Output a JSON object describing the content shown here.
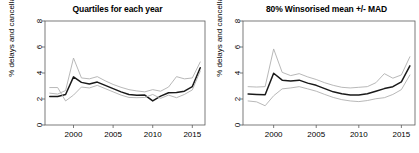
{
  "figure": {
    "width": 419,
    "height": 153,
    "background": "#ffffff",
    "panels": [
      "left",
      "right"
    ]
  },
  "chart_data": [
    {
      "panel": "left",
      "type": "line",
      "title": "Quartiles for each year",
      "xlabel": "",
      "ylabel": "% delays and cancellations",
      "xlim": [
        1996.4,
        2016.6
      ],
      "ylim": [
        0,
        8
      ],
      "xticks": [
        2000,
        2005,
        2010,
        2015
      ],
      "yticks": [
        0,
        2,
        4,
        6,
        8
      ],
      "grid": false,
      "legend": "none",
      "colors": {
        "median": "#1a1a1a",
        "quartile": "#a8a8a8"
      },
      "x": [
        1997,
        1998,
        1999,
        2000,
        2001,
        2002,
        2003,
        2004,
        2005,
        2006,
        2007,
        2008,
        2009,
        2010,
        2011,
        2012,
        2013,
        2014,
        2015,
        2016
      ],
      "series": [
        {
          "name": "Upper quartile",
          "style": "light-grey",
          "values": [
            2.45,
            2.38,
            2.65,
            5.15,
            3.62,
            3.55,
            3.72,
            3.4,
            3.12,
            2.9,
            2.72,
            2.62,
            2.55,
            2.72,
            2.6,
            2.92,
            3.72,
            3.55,
            3.62,
            4.85
          ]
        },
        {
          "name": "Median",
          "style": "dark",
          "values": [
            2.2,
            2.2,
            2.35,
            3.7,
            3.28,
            3.15,
            3.3,
            3.05,
            2.8,
            2.55,
            2.35,
            2.28,
            2.3,
            1.85,
            2.22,
            2.48,
            2.5,
            2.6,
            2.95,
            4.4
          ]
        },
        {
          "name": "Lower quartile",
          "style": "light-grey",
          "values": [
            2.88,
            2.88,
            1.85,
            2.3,
            2.92,
            2.85,
            3.05,
            2.8,
            2.55,
            2.3,
            2.12,
            2.1,
            2.12,
            2.35,
            2.05,
            2.3,
            2.1,
            2.35,
            2.7,
            4.15
          ]
        }
      ]
    },
    {
      "panel": "right",
      "type": "line",
      "title": "80% Winsorised mean +/- MAD",
      "xlabel": "",
      "ylabel": "% delays and cancellations",
      "xlim": [
        1996.4,
        2016.6
      ],
      "ylim": [
        0,
        8
      ],
      "xticks": [
        2000,
        2005,
        2010,
        2015
      ],
      "yticks": [
        0,
        2,
        4,
        6,
        8
      ],
      "grid": false,
      "legend": "none",
      "colors": {
        "mean": "#1a1a1a",
        "band": "#a8a8a8"
      },
      "x": [
        1997,
        1998,
        1999,
        2000,
        2001,
        2002,
        2003,
        2004,
        2005,
        2006,
        2007,
        2008,
        2009,
        2010,
        2011,
        2012,
        2013,
        2014,
        2015,
        2016
      ],
      "series": [
        {
          "name": "Mean + MAD",
          "style": "light-grey",
          "values": [
            2.95,
            2.92,
            2.95,
            5.85,
            4.05,
            3.8,
            3.95,
            3.7,
            3.5,
            3.25,
            3.05,
            2.9,
            2.85,
            2.9,
            2.95,
            3.25,
            3.95,
            3.6,
            3.85,
            5.25
          ]
        },
        {
          "name": "Winsorised mean",
          "style": "dark",
          "values": [
            2.38,
            2.35,
            2.32,
            3.98,
            3.45,
            3.38,
            3.45,
            3.22,
            3.05,
            2.8,
            2.55,
            2.4,
            2.3,
            2.3,
            2.4,
            2.6,
            2.8,
            2.95,
            3.32,
            4.55
          ]
        },
        {
          "name": "Mean - MAD",
          "style": "light-grey",
          "values": [
            1.85,
            1.78,
            1.48,
            2.25,
            2.78,
            2.85,
            2.95,
            2.78,
            2.6,
            2.35,
            2.12,
            1.95,
            1.85,
            1.8,
            1.88,
            2.02,
            2.1,
            2.35,
            2.72,
            3.85
          ]
        }
      ]
    }
  ],
  "axes": {
    "ylabel_text": "% delays and cancellations",
    "ytick_labels": [
      "0",
      "2",
      "4",
      "6",
      "8"
    ],
    "xtick_labels": [
      "2000",
      "2005",
      "2010",
      "2015"
    ]
  },
  "titles": {
    "left": "Quartiles for each year",
    "right": "80% Winsorised mean +/- MAD"
  }
}
